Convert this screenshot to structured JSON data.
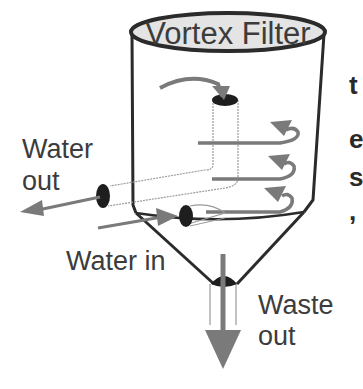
{
  "diagram": {
    "title": "Vortex Filter",
    "labels": {
      "water_out_line1": "Water",
      "water_out_line2": "out",
      "water_in": "Water in",
      "waste_line1": "Waste",
      "waste_line2": "out"
    },
    "cropped_side_text": [
      "t",
      "e",
      "s",
      ","
    ],
    "colors": {
      "outline": "#2b2b2b",
      "lid_fill": "#e4e4e4",
      "arrow": "#7a7a7a",
      "text": "#3c3c3c",
      "pipe_end": "#1e1e1e",
      "pipe_outline": "#9a9a9a"
    }
  }
}
